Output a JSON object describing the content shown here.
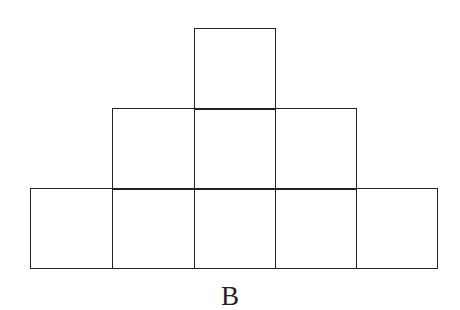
{
  "figure": {
    "label": "B",
    "line_color": "#222222",
    "rows": [
      {
        "row": 1,
        "cells": 1,
        "columns": [
          3
        ]
      },
      {
        "row": 2,
        "cells": 3,
        "columns": [
          2,
          3,
          4
        ]
      },
      {
        "row": 3,
        "cells": 5,
        "columns": [
          1,
          2,
          3,
          4,
          5
        ]
      }
    ],
    "total_squares": 9
  }
}
